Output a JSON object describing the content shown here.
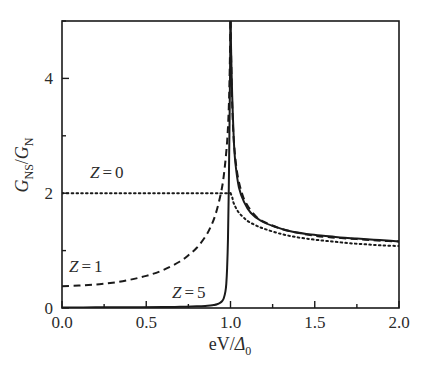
{
  "figure": {
    "background_color": "#ffffff",
    "line_color": "#1a1a1a",
    "text_color": "#2b2b2b"
  },
  "axes": {
    "x_title_main": "eV/",
    "x_title_delta": "Δ",
    "x_title_sub": "0",
    "y_title_g1": "G",
    "y_title_sub1": "NS",
    "y_title_slash": "/",
    "y_title_g2": "G",
    "y_title_sub2": "N",
    "x_ticks": [
      "0.0",
      "0.5",
      "1.0",
      "1.5",
      "2.0"
    ],
    "y_ticks": [
      "0",
      "2",
      "4"
    ]
  },
  "labels": {
    "z0": {
      "var": "Z",
      "eq": "=",
      "val": "0"
    },
    "z1": {
      "var": "Z",
      "eq": "=",
      "val": "1"
    },
    "z5": {
      "var": "Z",
      "eq": "=",
      "val": "5"
    }
  },
  "chart_data": {
    "type": "line",
    "title": "",
    "xlabel": "eV/Δ0",
    "ylabel": "GNS/GN",
    "xlim": [
      0.0,
      2.0
    ],
    "ylim": [
      0.0,
      5.0
    ],
    "xticks": [
      0.0,
      0.5,
      1.0,
      1.5,
      2.0
    ],
    "yticks": [
      0,
      2,
      4
    ],
    "x_minor_tick_step": 0.25,
    "y_minor_tick_step": 1.0,
    "grid": false,
    "legend": "inline-annotations",
    "series": [
      {
        "name": "Z = 0",
        "style": "dotted",
        "annotation": "Z = 0",
        "annotation_x": 0.37,
        "annotation_y": 2.35,
        "x": [
          0.0,
          0.1,
          0.2,
          0.3,
          0.4,
          0.5,
          0.6,
          0.7,
          0.8,
          0.9,
          0.95,
          0.99,
          1.0,
          1.01,
          1.02,
          1.05,
          1.1,
          1.15,
          1.2,
          1.3,
          1.4,
          1.5,
          1.6,
          1.7,
          1.8,
          1.9,
          2.0
        ],
        "y": [
          2.0,
          2.0,
          2.0,
          2.0,
          2.0,
          2.0,
          2.0,
          2.0,
          2.0,
          2.0,
          2.0,
          2.0,
          2.0,
          1.93,
          1.82,
          1.66,
          1.52,
          1.44,
          1.38,
          1.29,
          1.23,
          1.19,
          1.16,
          1.13,
          1.11,
          1.09,
          1.08
        ]
      },
      {
        "name": "Z = 1",
        "style": "dashed",
        "annotation": "Z = 1",
        "annotation_x": 0.235,
        "annotation_y": 0.72,
        "x": [
          0.0,
          0.1,
          0.2,
          0.3,
          0.4,
          0.5,
          0.6,
          0.7,
          0.75,
          0.8,
          0.85,
          0.88,
          0.91,
          0.94,
          0.96,
          0.98,
          0.99,
          0.995,
          1.0,
          1.005,
          1.01,
          1.02,
          1.04,
          1.07,
          1.1,
          1.15,
          1.2,
          1.3,
          1.4,
          1.5,
          1.6,
          1.7,
          1.8,
          1.9,
          2.0
        ],
        "y": [
          0.38,
          0.39,
          0.41,
          0.44,
          0.49,
          0.56,
          0.66,
          0.81,
          0.92,
          1.05,
          1.24,
          1.4,
          1.62,
          1.96,
          2.3,
          2.9,
          3.5,
          4.1,
          5.0,
          4.2,
          3.55,
          2.9,
          2.35,
          1.98,
          1.79,
          1.6,
          1.5,
          1.38,
          1.31,
          1.26,
          1.23,
          1.21,
          1.19,
          1.17,
          1.16
        ]
      },
      {
        "name": "Z = 5",
        "style": "solid",
        "annotation": "Z = 5",
        "annotation_x": 0.8,
        "annotation_y": 0.3,
        "x": [
          0.0,
          0.2,
          0.4,
          0.6,
          0.7,
          0.8,
          0.85,
          0.88,
          0.9,
          0.92,
          0.94,
          0.95,
          0.96,
          0.97,
          0.975,
          0.98,
          0.985,
          0.99,
          0.995,
          1.0,
          1.005,
          1.01,
          1.02,
          1.03,
          1.05,
          1.08,
          1.12,
          1.18,
          1.25,
          1.35,
          1.45,
          1.55,
          1.65,
          1.75,
          1.85,
          1.95,
          2.0
        ],
        "y": [
          0.01,
          0.011,
          0.013,
          0.017,
          0.021,
          0.029,
          0.036,
          0.044,
          0.052,
          0.066,
          0.095,
          0.12,
          0.17,
          0.29,
          0.42,
          0.7,
          1.2,
          2.1,
          3.4,
          5.0,
          4.3,
          3.7,
          2.9,
          2.5,
          2.1,
          1.85,
          1.66,
          1.52,
          1.43,
          1.34,
          1.29,
          1.26,
          1.23,
          1.21,
          1.19,
          1.17,
          1.16
        ]
      }
    ]
  }
}
